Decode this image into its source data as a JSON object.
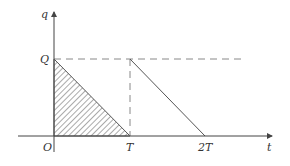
{
  "diagram": {
    "type": "charge-time graph",
    "axes": {
      "x_label": "t",
      "y_label": "q",
      "origin_label": "O"
    },
    "labels": {
      "Q": "Q",
      "T": "T",
      "2T": "2T"
    },
    "elements": [
      {
        "kind": "shaded-triangle",
        "vertices": [
          "(0,Q)",
          "(0,0)",
          "(T,0)"
        ],
        "fill": "hatched"
      },
      {
        "kind": "solid-line",
        "from": "(T,Q)",
        "to": "(2T,0)"
      },
      {
        "kind": "dashed-line",
        "from": "(0,Q)",
        "to": "beyond 2T",
        "orientation": "horizontal"
      },
      {
        "kind": "dashed-line",
        "from": "(T,Q)",
        "to": "(T,0)",
        "orientation": "vertical"
      }
    ],
    "colors": {
      "line": "#555555",
      "dashed": "#888888",
      "text": "#333333"
    }
  }
}
